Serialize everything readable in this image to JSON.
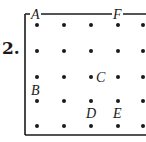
{
  "problem": {
    "number": "2."
  },
  "grid": {
    "cols_x": [
      37,
      64,
      91,
      118,
      143
    ],
    "rows_y": [
      25,
      51,
      77,
      101,
      126
    ],
    "dot_color": "#1a1a1a",
    "frame_color": "#1a1a1a"
  },
  "frame": {
    "left_x": 25,
    "top_y": 14,
    "bottom_y": 135
  },
  "points": [
    {
      "label": "A",
      "x": 37,
      "y": 25,
      "label_x": 31,
      "label_y": 19
    },
    {
      "label": "F",
      "x": 118,
      "y": 25,
      "label_x": 113,
      "label_y": 19
    },
    {
      "label": "B",
      "x": 37,
      "y": 89,
      "label_x": 31,
      "label_y": 95
    },
    {
      "label": "C",
      "x": 91,
      "y": 77,
      "label_x": 96,
      "label_y": 82
    },
    {
      "label": "D",
      "x": 91,
      "y": 101,
      "label_x": 86,
      "label_y": 118
    },
    {
      "label": "E",
      "x": 118,
      "y": 101,
      "label_x": 113,
      "label_y": 118
    }
  ]
}
